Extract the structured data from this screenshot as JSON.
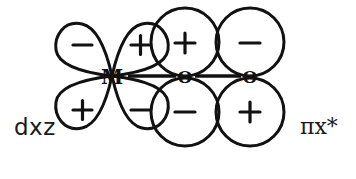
{
  "figure": {
    "title": "d-orbital to pi-antibonding orbital overlap diagram",
    "background_color": "#ffffff",
    "stroke_color": "#111111",
    "stroke_width": 3,
    "width": 356,
    "height": 179
  },
  "labels": {
    "left_orbital": "dxz",
    "right_orbital": "πx*"
  },
  "atoms": [
    {
      "symbol": "M",
      "cx": 112,
      "cy": 76,
      "font_size": 19
    },
    {
      "symbol": "O",
      "cx": 185,
      "cy": 76,
      "font_size": 16
    },
    {
      "symbol": "O",
      "cx": 250,
      "cy": 76,
      "font_size": 16
    }
  ],
  "bonds": [
    {
      "from": "M",
      "to": "O1",
      "x1": 127,
      "y1": 76,
      "x2": 176,
      "y2": 76
    },
    {
      "from": "O1",
      "to": "O2",
      "x1": 194,
      "y1": 76,
      "x2": 241,
      "y2": 76
    }
  ],
  "lobes": [
    {
      "id": "d-top-left",
      "sign": "−",
      "sx": 82,
      "sy": 44,
      "shape": "teardrop"
    },
    {
      "id": "d-top-right",
      "sign": "+",
      "sx": 140,
      "sy": 44,
      "shape": "teardrop"
    },
    {
      "id": "d-bottom-left",
      "sign": "+",
      "sx": 82,
      "sy": 112,
      "shape": "teardrop"
    },
    {
      "id": "d-bottom-right",
      "sign": "−",
      "sx": 140,
      "sy": 112,
      "shape": "teardrop"
    },
    {
      "id": "p1-top",
      "sign": "+",
      "sx": 185,
      "sy": 42,
      "shape": "circle"
    },
    {
      "id": "p1-bottom",
      "sign": "−",
      "sx": 185,
      "sy": 112,
      "shape": "circle"
    },
    {
      "id": "p2-top",
      "sign": "−",
      "sx": 250,
      "sy": 42,
      "shape": "circle"
    },
    {
      "id": "p2-bottom",
      "sign": "+",
      "sx": 250,
      "sy": 112,
      "shape": "circle"
    }
  ],
  "sign_font_size": 22
}
